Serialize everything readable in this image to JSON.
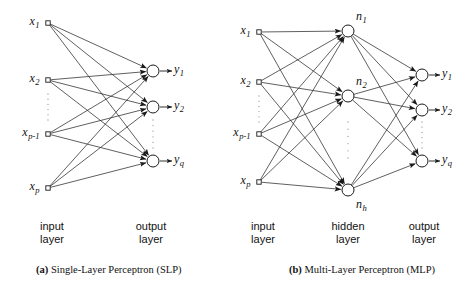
{
  "figure": {
    "type": "neural-network-architecture-diagram",
    "background_color": "#ffffff",
    "stroke_color": "#1a1a1a",
    "node_fill": "#ffffff"
  },
  "panels": [
    {
      "id": "slp",
      "caption_prefix": "(a)",
      "caption_text": "Single-Layer Perceptron (SLP)",
      "layer_labels": [
        {
          "name": "input-layer-label",
          "line1": "input",
          "line2": "layer",
          "x": 52,
          "y": 220
        },
        {
          "name": "output-layer-label",
          "line1": "output",
          "line2": "layer",
          "x": 151,
          "y": 220
        }
      ],
      "input_nodes": [
        {
          "label": "x",
          "sub": "1",
          "cx": 48,
          "cy": 23
        },
        {
          "label": "x",
          "sub": "2",
          "cx": 48,
          "cy": 80
        },
        {
          "label": "x",
          "sub": "p-1",
          "cx": 48,
          "cy": 134
        },
        {
          "label": "x",
          "sub": "p",
          "cx": 48,
          "cy": 188
        }
      ],
      "output_nodes": [
        {
          "label": "y",
          "sub": "1",
          "cx": 153,
          "cy": 71
        },
        {
          "label": "y",
          "sub": "2",
          "cx": 153,
          "cy": 107
        },
        {
          "label": "y",
          "sub": "q",
          "cx": 153,
          "cy": 161
        }
      ],
      "ellipsis": [
        {
          "name": "input-ellipsis",
          "x": 48,
          "y_start": 94,
          "y_end": 120
        },
        {
          "name": "output-ellipsis",
          "x": 153,
          "y_start": 120,
          "y_end": 148
        }
      ]
    },
    {
      "id": "mlp",
      "caption_prefix": "(b)",
      "caption_text": "Multi-Layer Perceptron (MLP)",
      "layer_labels": [
        {
          "name": "input-layer-label",
          "line1": "input",
          "line2": "layer",
          "x": 263,
          "y": 220
        },
        {
          "name": "hidden-layer-label",
          "line1": "hidden",
          "line2": "layer",
          "x": 348,
          "y": 220
        },
        {
          "name": "output-layer-label",
          "line1": "output",
          "line2": "layer",
          "x": 424,
          "y": 220
        }
      ],
      "input_nodes": [
        {
          "label": "x",
          "sub": "1",
          "cx": 259,
          "cy": 32
        },
        {
          "label": "x",
          "sub": "2",
          "cx": 259,
          "cy": 82
        },
        {
          "label": "x",
          "sub": "p-1",
          "cx": 259,
          "cy": 134
        },
        {
          "label": "x",
          "sub": "p",
          "cx": 259,
          "cy": 182
        }
      ],
      "hidden_nodes": [
        {
          "label": "n",
          "sub": "1",
          "cx": 348,
          "cy": 31
        },
        {
          "label": "n",
          "sub": "2",
          "cx": 348,
          "cy": 96
        },
        {
          "label": "n",
          "sub": "h",
          "cx": 348,
          "cy": 190
        }
      ],
      "output_nodes": [
        {
          "label": "y",
          "sub": "1",
          "cx": 422,
          "cy": 75
        },
        {
          "label": "y",
          "sub": "2",
          "cx": 422,
          "cy": 110
        },
        {
          "label": "y",
          "sub": "q",
          "cx": 422,
          "cy": 161
        }
      ],
      "ellipsis": [
        {
          "name": "input-ellipsis",
          "x": 259,
          "y_start": 96,
          "y_end": 122
        },
        {
          "name": "hidden-ellipsis",
          "x": 348,
          "y_start": 122,
          "y_end": 158
        },
        {
          "name": "output-ellipsis",
          "x": 422,
          "y_start": 122,
          "y_end": 148
        }
      ]
    }
  ],
  "captions": {
    "left": {
      "prefix": "(a)",
      "text": " Single-Layer Perceptron (SLP)",
      "x": 36,
      "y": 264
    },
    "right": {
      "prefix": "(b)",
      "text": " Multi-Layer Perceptron (MLP)",
      "x": 289,
      "y": 264
    }
  }
}
